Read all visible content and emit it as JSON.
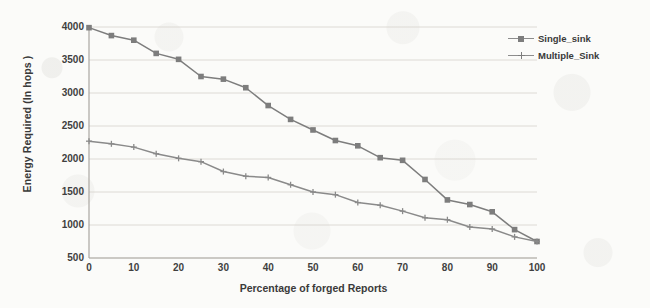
{
  "chart_data": {
    "type": "line",
    "title": "",
    "xlabel": "Percentage of forged Reports",
    "ylabel": "Energy Required (In hops )",
    "x": [
      0,
      5,
      10,
      15,
      20,
      25,
      30,
      35,
      40,
      45,
      50,
      55,
      60,
      65,
      70,
      75,
      80,
      85,
      90,
      95,
      100
    ],
    "xlim": [
      0,
      100
    ],
    "ylim": [
      500,
      4000
    ],
    "xticks": [
      "0",
      "10",
      "20",
      "30",
      "40",
      "50",
      "60",
      "70",
      "80",
      "90",
      "100"
    ],
    "yticks": [
      "500",
      "1000",
      "1500",
      "2000",
      "2500",
      "3000",
      "3500",
      "4000"
    ],
    "grid": "horizontal",
    "legend_position": "top-right",
    "series": [
      {
        "name": "Single_sink",
        "marker": "square",
        "color": "#7d7d7d",
        "values": [
          3990,
          3870,
          3800,
          3600,
          3510,
          3250,
          3210,
          3080,
          2810,
          2600,
          2440,
          2280,
          2200,
          2020,
          1980,
          1690,
          1380,
          1310,
          1200,
          930,
          750
        ]
      },
      {
        "name": "Multiple_Sink",
        "marker": "cross",
        "color": "#8a8a8a",
        "values": [
          2270,
          2230,
          2180,
          2080,
          2010,
          1960,
          1810,
          1740,
          1720,
          1610,
          1500,
          1460,
          1340,
          1300,
          1210,
          1110,
          1080,
          970,
          940,
          820,
          750
        ]
      }
    ]
  },
  "legend": {
    "items": [
      {
        "label": "Single_sink"
      },
      {
        "label": "Multiple_Sink"
      }
    ]
  },
  "axes": {
    "x_title": "Percentage of forged Reports",
    "y_title": "Energy Required (In hops )"
  },
  "colors": {
    "series_single": "#7d7d7d",
    "series_multiple": "#8a8a8a",
    "grid": "#d9d6d0",
    "axis": "#aaa7a1",
    "text": "#3a3a3a",
    "background": "#fbfbf9"
  }
}
